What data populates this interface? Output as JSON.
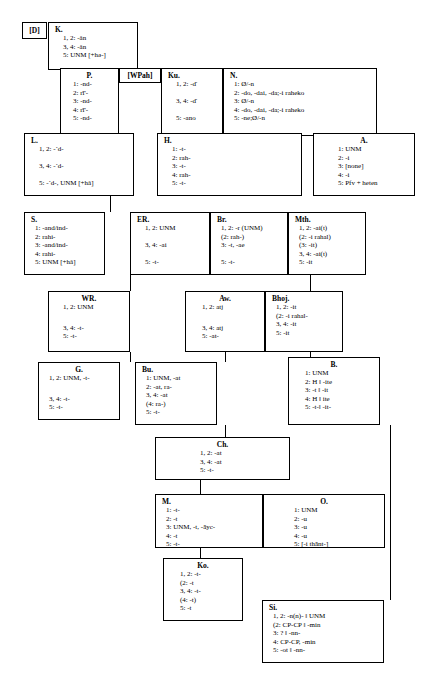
{
  "diagram": {
    "type": "stemma-tree",
    "tags": [
      {
        "id": "D",
        "label": "[D]"
      },
      {
        "id": "WPah",
        "label": "[WPah]"
      }
    ],
    "nodes": [
      {
        "id": "K",
        "header": "K.",
        "lines": [
          "1, 2: -ǎn",
          "3, 4: -ǎn",
          "5: UNM [+hǝ-]"
        ]
      },
      {
        "id": "P",
        "header": "P.",
        "lines": [
          "1: -nd-",
          "2: rī'-",
          "3: -nd-",
          "4: rī'-",
          "5: -nd-"
        ]
      },
      {
        "id": "Ku",
        "header": "Ku.",
        "lines": [
          "1, 2: -ď",
          "",
          "3, 4: -ď",
          "",
          "5: -ano"
        ]
      },
      {
        "id": "N",
        "header": "N.",
        "lines": [
          "1: Ø/-n",
          "2: -do, -dai, -da;-i raheko",
          "3: Ø/-n",
          "4: -do, -dai, -da;-i raheko",
          "5: -ne;Ø/-n"
        ]
      },
      {
        "id": "L",
        "header": "L.",
        "lines": [
          "1, 2: -ˊd-",
          "",
          "3, 4: -ˊd-",
          "",
          "5: -ˊd-, UNM [+hǎ]"
        ]
      },
      {
        "id": "H",
        "header": "H.",
        "lines": [
          "1: -t-",
          "2: rah-",
          "3: -t-",
          "4: rah-",
          "5: -t-"
        ]
      },
      {
        "id": "A",
        "header": "A.",
        "lines": [
          "1: UNM",
          "2: -i",
          "3: [none]",
          "4: -i",
          "5: Pfv + heten"
        ]
      },
      {
        "id": "S",
        "header": "S.",
        "lines": [
          "1: -and/ind-",
          "2: rahi-",
          "3: -and/ind-",
          "4: rahi-",
          "5: UNM [+hǎ]"
        ]
      },
      {
        "id": "ER",
        "header": "ER.",
        "lines": [
          "1, 2: UNM",
          "",
          "3, 4: -ai",
          "",
          "5: -t-"
        ]
      },
      {
        "id": "Br",
        "header": "Br.",
        "lines": [
          "1, 2: -r (UNM)",
          "(2: rah-)",
          "3: -t, -ae",
          "",
          "5: -t-"
        ]
      },
      {
        "id": "Mth",
        "header": "Mth.",
        "lines": [
          "1, 2: -ai(t)",
          "(2: -i rahal)",
          "(3: -it)",
          "3, 4: -ai(t)",
          "5: -it"
        ]
      },
      {
        "id": "WR",
        "header": "WR.",
        "lines": [
          "1, 2: UNM",
          "",
          "3, 4: -t-",
          "5: -t-"
        ]
      },
      {
        "id": "Aw",
        "header": "Aw.",
        "lines": [
          "1, 2: atj",
          "",
          "3, 4: atj",
          "5: -at-"
        ]
      },
      {
        "id": "Bhoj",
        "header": "Bhoj.",
        "lines": [
          "1, 2: -it",
          "(2: -i rahal-",
          "3, 4: -it",
          "5: -it"
        ]
      },
      {
        "id": "G",
        "header": "G.",
        "lines": [
          "1, 2: UNM, -t-",
          "",
          "3, 4: -t-",
          "5: -t-"
        ]
      },
      {
        "id": "Bu",
        "header": "Bu.",
        "lines": [
          "1: UNM, -at",
          "2: -at, ra-",
          "3, 4: -at",
          "(4: ra-)",
          "5: -t-"
        ]
      },
      {
        "id": "B",
        "header": "B.",
        "lines": [
          "1: UNM",
          "2: H ‖ -ite",
          "3: -t ‖ -it",
          "4: H ‖ ite",
          "5: -t-‖ -it-"
        ]
      },
      {
        "id": "Ch",
        "header": "Ch.",
        "lines": [
          "1, 2: -at",
          "3, 4: -at",
          "5: -t-"
        ]
      },
      {
        "id": "M",
        "header": "M.",
        "lines": [
          "1: -t-",
          "2: -t",
          "3: UNM, -t, -āyc-",
          "4: -t",
          "5: -t-"
        ]
      },
      {
        "id": "O",
        "header": "O.",
        "lines": [
          "1: UNM",
          "2: -u",
          "3: -u",
          "4: -u",
          "5: [-i thānt-]"
        ]
      },
      {
        "id": "Ko",
        "header": "Ko.",
        "lines": [
          "1, 2: -t-",
          "(2: -t",
          "3, 4: -t-",
          "(4: -t)",
          "5: -t"
        ]
      },
      {
        "id": "Si",
        "header": "Si.",
        "lines": [
          "1, 2: -n(n)- ‖ UNM",
          "(2: CP-CP ‖ -min",
          "3: ? ‖ -nn-",
          "4: CP-CP, -min",
          "5: -ot ‖ -nn-"
        ]
      }
    ]
  }
}
